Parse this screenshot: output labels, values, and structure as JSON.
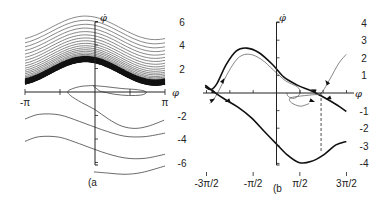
{
  "chart_data": [
    {
      "panel": "(a",
      "type": "line",
      "title": "",
      "xlabel": "φ",
      "ylabel": "φ̇",
      "xlim": [
        -3.1416,
        3.1416
      ],
      "ylim": [
        -7,
        7
      ],
      "x_ticks": [
        {
          "value": -3.1416,
          "label": "-π"
        },
        {
          "value": -1.5708,
          "label": ""
        },
        {
          "value": 1.5708,
          "label": ""
        },
        {
          "value": 3.1416,
          "label": "π"
        }
      ],
      "y_ticks": [
        {
          "value": 6,
          "label": "6"
        },
        {
          "value": 4,
          "label": "4"
        },
        {
          "value": 2,
          "label": "2"
        },
        {
          "value": -2,
          "label": "-2"
        },
        {
          "value": -4,
          "label": "-4"
        },
        {
          "value": -6,
          "label": "-6"
        }
      ],
      "grid": false,
      "legend": null,
      "series": [
        {
          "name": "upper running trajectories (dense band)",
          "description": "family of sinusoidal curves phi_dot = c + 1.0*sin(phi + 2.0), c from ~1.6 to ~5.4, accumulating densely toward lower edge near c≈1.6",
          "amplitude": 1.0,
          "phase": 2.0,
          "offsets": [
            1.6,
            1.62,
            1.65,
            1.68,
            1.72,
            1.76,
            1.8,
            1.86,
            1.92,
            2.0,
            2.1,
            2.2,
            2.32,
            2.46,
            2.6,
            2.76,
            2.94,
            3.14,
            3.36,
            3.6,
            3.86,
            4.14,
            4.44,
            4.76,
            5.1,
            5.46
          ]
        },
        {
          "name": "transient spiral",
          "description": "trajectory starting near (-0.8, 0.3) looping around toward (2.1, -0.1) then down",
          "points": [
            [
              -0.1,
              0.55
            ],
            [
              -0.7,
              0.45
            ],
            [
              -1.2,
              0.1
            ],
            [
              -1.1,
              -0.3
            ],
            [
              -0.6,
              -0.9
            ],
            [
              0.0,
              -1.5
            ],
            [
              0.6,
              -2.3
            ],
            [
              1.2,
              -2.9
            ],
            [
              1.8,
              -3.1
            ],
            [
              2.4,
              -2.9
            ],
            [
              3.1,
              -2.4
            ]
          ]
        },
        {
          "name": "limit loop",
          "description": "closed loop near phi_dot=0",
          "points": [
            [
              -0.1,
              0.55
            ],
            [
              0.5,
              0.45
            ],
            [
              1.2,
              0.3
            ],
            [
              1.9,
              0.2
            ],
            [
              2.3,
              0.0
            ],
            [
              2.1,
              -0.25
            ],
            [
              1.5,
              -0.3
            ],
            [
              0.9,
              -0.2
            ],
            [
              0.4,
              0.0
            ],
            [
              0.2,
              0.1
            ]
          ]
        },
        {
          "name": "lower trajectory 1",
          "points": [
            [
              -3.14,
              -2.3
            ],
            [
              -2.5,
              -1.9
            ],
            [
              -1.6,
              -1.95
            ],
            [
              -0.7,
              -2.5
            ],
            [
              0.3,
              -3.2
            ],
            [
              1.3,
              -3.75
            ],
            [
              2.2,
              -3.8
            ],
            [
              3.14,
              -3.5
            ]
          ]
        },
        {
          "name": "lower trajectory 2",
          "points": [
            [
              -3.14,
              -4.2
            ],
            [
              -2.5,
              -3.8
            ],
            [
              -1.6,
              -3.85
            ],
            [
              -0.7,
              -4.4
            ],
            [
              0.3,
              -5.1
            ],
            [
              1.3,
              -5.6
            ],
            [
              2.2,
              -5.65
            ],
            [
              3.14,
              -5.3
            ]
          ]
        },
        {
          "name": "lower trajectory 3 (partial, near axis)",
          "points": [
            [
              -0.05,
              -6.8
            ],
            [
              0.6,
              -6.9
            ],
            [
              1.3,
              -7.0
            ],
            [
              2.1,
              -6.85
            ],
            [
              3.14,
              -6.3
            ]
          ]
        }
      ]
    },
    {
      "panel": "(b",
      "type": "line",
      "title": "",
      "xlabel": "φ",
      "ylabel": "φ̇",
      "xlim": [
        -4.712,
        4.712
      ],
      "ylim": [
        -4,
        4
      ],
      "x_ticks": [
        {
          "value": -4.712,
          "label": "-3π/2"
        },
        {
          "value": -1.571,
          "label": "-π/2"
        },
        {
          "value": 1.571,
          "label": "π/2"
        },
        {
          "value": 4.712,
          "label": "3π/2"
        }
      ],
      "y_ticks": [
        {
          "value": 4,
          "label": "4"
        },
        {
          "value": 3,
          "label": "3"
        },
        {
          "value": 2,
          "label": "2"
        },
        {
          "value": 1,
          "label": "1"
        },
        {
          "value": -1,
          "label": "-1"
        },
        {
          "value": -2,
          "label": "-2"
        },
        {
          "value": -3,
          "label": "-3"
        },
        {
          "value": -4,
          "label": "-4"
        }
      ],
      "grid": false,
      "legend": null,
      "series": [
        {
          "name": "separatrix upper (thick)",
          "points": [
            [
              -4.8,
              0.35
            ],
            [
              -4.4,
              0.2
            ],
            [
              -4.0,
              0.55
            ],
            [
              -3.4,
              1.6
            ],
            [
              -2.7,
              2.4
            ],
            [
              -2.0,
              2.55
            ],
            [
              -1.2,
              2.3
            ],
            [
              -0.3,
              1.65
            ],
            [
              0.5,
              0.9
            ],
            [
              1.4,
              0.45
            ],
            [
              2.4,
              0.1
            ],
            [
              3.3,
              -0.3
            ],
            [
              4.1,
              -0.7
            ],
            [
              4.7,
              -1.05
            ]
          ]
        },
        {
          "name": "inner trajectory (thin)",
          "points": [
            [
              -4.5,
              -0.6
            ],
            [
              -4.1,
              -0.2
            ],
            [
              -3.6,
              0.6
            ],
            [
              -3.1,
              1.4
            ],
            [
              -2.5,
              2.05
            ],
            [
              -1.8,
              2.2
            ],
            [
              -1.0,
              1.9
            ],
            [
              -0.2,
              1.3
            ],
            [
              0.6,
              0.7
            ],
            [
              1.4,
              0.35
            ],
            [
              1.6,
              0.0
            ],
            [
              1.2,
              -0.3
            ],
            [
              0.8,
              -0.2
            ],
            [
              0.7,
              0.0
            ]
          ]
        },
        {
          "name": "unstable manifold to right (thin)",
          "points": [
            [
              2.2,
              -0.6
            ],
            [
              1.6,
              -0.75
            ],
            [
              1.0,
              -0.55
            ],
            [
              0.9,
              -0.3
            ],
            [
              1.4,
              -0.2
            ],
            [
              2.4,
              -0.1
            ],
            [
              3.0,
              0.0
            ],
            [
              3.6,
              0.8
            ],
            [
              4.2,
              1.7
            ],
            [
              4.7,
              2.2
            ]
          ]
        },
        {
          "name": "lower separatrix (thick)",
          "points": [
            [
              -4.8,
              0.45
            ],
            [
              -4.2,
              0.05
            ],
            [
              -3.4,
              -0.4
            ],
            [
              -2.6,
              -0.8
            ],
            [
              -1.7,
              -1.4
            ],
            [
              -0.8,
              -2.2
            ],
            [
              0.0,
              -2.9
            ],
            [
              0.7,
              -3.5
            ],
            [
              1.5,
              -3.95
            ],
            [
              2.3,
              -3.9
            ],
            [
              3.2,
              -3.5
            ],
            [
              4.0,
              -2.95
            ],
            [
              4.7,
              -2.75
            ]
          ]
        }
      ],
      "annotations": [
        {
          "type": "dashed-vline",
          "x": 3.0,
          "y_from": 0,
          "y_to": -3.4
        },
        {
          "type": "saddle-point",
          "x": 3.0,
          "y": 0
        },
        {
          "type": "saddle-point",
          "x": -3.9,
          "y": 0
        }
      ]
    }
  ],
  "panels": {
    "a": {
      "label": "(a",
      "x_axis_name": "φ",
      "y_axis_name": "φ̇"
    },
    "b": {
      "label": "(b",
      "x_axis_name": "φ",
      "y_axis_name": "φ̇"
    }
  }
}
